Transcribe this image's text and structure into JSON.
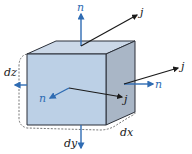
{
  "diagram": {
    "colors": {
      "front_face": "#bcd0e6",
      "top_face": "#cbd8e8",
      "side_face": "#a9b6c6",
      "edge": "#2a2f38",
      "normal_arrow": "#2f6cb3",
      "current_arrow": "#1a1a1a",
      "dashed": "#555555"
    },
    "labels": {
      "n_top": "n",
      "j_top": "j",
      "j_right": "j",
      "n_right": "n",
      "dz": "dz",
      "n_front": "n",
      "j_front": "j",
      "dx": "dx",
      "dy": "dy"
    }
  }
}
